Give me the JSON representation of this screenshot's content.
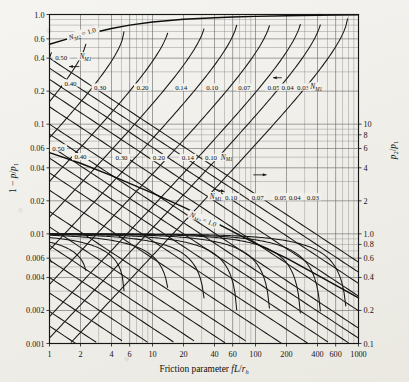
{
  "figure": {
    "name": "fanno-flow-friction-chart",
    "background_color": "#efeee9",
    "ink_color": "#161616"
  },
  "chart_data": {
    "type": "line",
    "title": "",
    "xlabel": "Friction parameter fL/r_h",
    "xlabel_parts": {
      "prefix": "Friction parameter ",
      "italic": "fL",
      "slash": "/",
      "sub_base": "r",
      "sub": "h"
    },
    "ylabel_left": "1 − p/p₁",
    "ylabel_left_parts": {
      "lead": "1 − ",
      "num": "p",
      "slash": "/",
      "den": "p",
      "den_sub": "1"
    },
    "ylabel_right": "p₂/p₁",
    "ylabel_right_parts": {
      "num": "p",
      "num_sub": "2",
      "slash": "/",
      "den": "p",
      "den_sub": "1"
    },
    "xscale": "log",
    "yscale": "log",
    "xlim": [
      1,
      1000
    ],
    "ylim_left": [
      0.001,
      1.0
    ],
    "ylim_right": [
      0.01,
      10
    ],
    "grid": true,
    "legend_position": "inline-annotations",
    "x_ticks": [
      {
        "value": 1,
        "label": "1"
      },
      {
        "value": 2,
        "label": "2"
      },
      {
        "value": 4,
        "label": "4"
      },
      {
        "value": 6,
        "label": "6"
      },
      {
        "value": 10,
        "label": "10"
      },
      {
        "value": 20,
        "label": "20"
      },
      {
        "value": 40,
        "label": "40"
      },
      {
        "value": 60,
        "label": "60"
      },
      {
        "value": 100,
        "label": "100"
      },
      {
        "value": 200,
        "label": "200"
      },
      {
        "value": 400,
        "label": "400"
      },
      {
        "value": 600,
        "label": "600"
      },
      {
        "value": 1000,
        "label": "1000"
      }
    ],
    "y_ticks_left": [
      {
        "value": 1.0,
        "label": "1.0"
      },
      {
        "value": 0.6,
        "label": "0.6"
      },
      {
        "value": 0.4,
        "label": "0.4"
      },
      {
        "value": 0.2,
        "label": "0.2"
      },
      {
        "value": 0.1,
        "label": "0.1"
      },
      {
        "value": 0.06,
        "label": "0.06"
      },
      {
        "value": 0.04,
        "label": "0.04"
      },
      {
        "value": 0.02,
        "label": "0.02"
      },
      {
        "value": 0.01,
        "label": "0.01"
      },
      {
        "value": 0.006,
        "label": "0.006"
      },
      {
        "value": 0.004,
        "label": "0.004"
      },
      {
        "value": 0.002,
        "label": "0.002"
      },
      {
        "value": 0.001,
        "label": "0.001"
      }
    ],
    "y_ticks_right": [
      {
        "value": 10,
        "label": "10"
      },
      {
        "value": 8,
        "label": "8"
      },
      {
        "value": 6,
        "label": "6"
      },
      {
        "value": 4,
        "label": "4"
      },
      {
        "value": 2,
        "label": "2"
      },
      {
        "value": 1.0,
        "label": "1.0"
      },
      {
        "value": 0.8,
        "label": "0.8"
      },
      {
        "value": 0.6,
        "label": "0.6"
      },
      {
        "value": 0.4,
        "label": "0.4"
      },
      {
        "value": 0.2,
        "label": "0.2"
      },
      {
        "value": 0.1,
        "label": "0.1"
      },
      {
        "value": 0.08,
        "label": "0.08"
      },
      {
        "value": 0.06,
        "label": "0.06"
      },
      {
        "value": 0.04,
        "label": "0.04"
      },
      {
        "value": 0.02,
        "label": "0.02"
      },
      {
        "value": 0.01,
        "label": "0.01"
      }
    ],
    "annotations": {
      "nm2_top": {
        "text": "N",
        "sub": "M2",
        "rel": "= 1.0",
        "x": 1.9,
        "y": 0.62
      },
      "nm2_mid": {
        "text": "N",
        "sub": "M2",
        "rel": "= 1.0",
        "x": 28,
        "y": 0.0165
      },
      "nm1_upper_legend": {
        "text": "N",
        "sub": "M1",
        "x": 1.75,
        "y": 0.4
      },
      "nm1_upper_series_legend": {
        "text": "N",
        "sub": "M1",
        "x": 330,
        "y": 0.3
      },
      "nm1_mid_legend": {
        "text": "N",
        "sub": "M1",
        "x": 150,
        "y": 0.046
      },
      "nm1_lower_legend": {
        "text": "N",
        "sub": "M1",
        "x": 45,
        "y": 0.0255
      }
    },
    "nm1_labels_upper": [
      "0.50",
      "0.40",
      "0.30",
      "0.20",
      "0.14",
      "0.10",
      "0.07",
      "0.05",
      "0.04",
      "0.03"
    ],
    "nm1_labels_mid": [
      "0.50",
      "0.40",
      "0.30",
      "0.20",
      "0.14",
      "0.10"
    ],
    "nm1_labels_lower": [
      "0.10",
      "0.07",
      "0.05",
      "0.04",
      "0.03"
    ],
    "series": [
      {
        "name": "N_M2 = 1.0 (upper choking limit)",
        "label": "N_M2 = 1.0",
        "kind": "envelope",
        "points": [
          [
            1,
            0.535
          ],
          [
            1.5,
            0.6
          ],
          [
            2,
            0.645
          ],
          [
            3,
            0.7
          ],
          [
            4,
            0.745
          ],
          [
            6,
            0.8
          ],
          [
            10,
            0.855
          ],
          [
            20,
            0.905
          ],
          [
            40,
            0.935
          ],
          [
            60,
            0.95
          ],
          [
            100,
            0.962
          ],
          [
            200,
            0.975
          ],
          [
            400,
            0.985
          ],
          [
            600,
            0.99
          ],
          [
            1000,
            0.995
          ]
        ]
      },
      {
        "name": "N_M2 = 1.0 (lower choking limit)",
        "label": "N_M2 = 1.0",
        "kind": "envelope",
        "points": [
          [
            1,
            0.055
          ],
          [
            2,
            0.044
          ],
          [
            4,
            0.034
          ],
          [
            10,
            0.0235
          ],
          [
            20,
            0.0175
          ],
          [
            40,
            0.0128
          ],
          [
            100,
            0.0082
          ],
          [
            200,
            0.006
          ],
          [
            400,
            0.0042
          ],
          [
            1000,
            0.0026
          ]
        ]
      },
      {
        "name": "N_M1 = 0.50",
        "value": 0.5,
        "kind": "nm1"
      },
      {
        "name": "N_M1 = 0.40",
        "value": 0.4,
        "kind": "nm1"
      },
      {
        "name": "N_M1 = 0.30",
        "value": 0.3,
        "kind": "nm1"
      },
      {
        "name": "N_M1 = 0.20",
        "value": 0.2,
        "kind": "nm1"
      },
      {
        "name": "N_M1 = 0.14",
        "value": 0.14,
        "kind": "nm1"
      },
      {
        "name": "N_M1 = 0.10",
        "value": 0.1,
        "kind": "nm1"
      },
      {
        "name": "N_M1 = 0.07",
        "value": 0.07,
        "kind": "nm1"
      },
      {
        "name": "N_M1 = 0.05",
        "value": 0.05,
        "kind": "nm1"
      },
      {
        "name": "N_M1 = 0.04",
        "value": 0.04,
        "kind": "nm1"
      },
      {
        "name": "N_M1 = 0.03",
        "value": 0.03,
        "kind": "nm1"
      }
    ]
  }
}
